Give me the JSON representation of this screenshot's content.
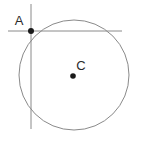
{
  "figure": {
    "width": 141,
    "height": 143,
    "background_color": "#ffffff"
  },
  "labels": {
    "point_a": "A",
    "point_c": "C"
  },
  "colors": {
    "circle_stroke": "#8a8a8a",
    "line_stroke": "#8a8a8a",
    "point_fill": "#1a1a1a",
    "label_fill": "#2b2b2b"
  },
  "geometry": {
    "circle": {
      "name": "main-circle",
      "center_x": 74,
      "center_y": 75,
      "radius": 55,
      "stroke_width": 1
    },
    "center_point": {
      "name": "point-c",
      "x": 73,
      "y": 76,
      "radius": 2.8
    },
    "intersection_point": {
      "name": "point-a",
      "x": 31,
      "y": 31,
      "radius": 3.0
    },
    "horizontal_line": {
      "name": "horizontal-line",
      "x1": 8,
      "y1": 31,
      "x2": 122,
      "y2": 31,
      "stroke_width": 1
    },
    "vertical_line": {
      "name": "vertical-line",
      "x1": 31,
      "y1": 4,
      "x2": 31,
      "y2": 129,
      "stroke_width": 1
    },
    "label_a_position": {
      "x": 19,
      "y": 25
    },
    "label_c_position": {
      "x": 79,
      "y": 70
    }
  }
}
